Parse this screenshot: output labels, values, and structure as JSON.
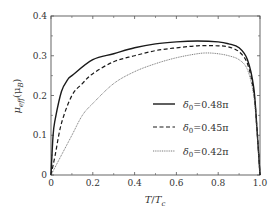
{
  "chart_data": {
    "type": "line",
    "title": "",
    "xlabel": "T/T_c",
    "ylabel": "μ_eff(μ_B)",
    "xlim": [
      0,
      1.0
    ],
    "ylim": [
      0,
      0.4
    ],
    "xticks": [
      0,
      0.2,
      0.4,
      0.6,
      0.8,
      1.0
    ],
    "xtick_labels": [
      "0",
      "0.2",
      "0.4",
      "0.6",
      "0.8",
      "1.0"
    ],
    "yticks": [
      0,
      0.1,
      0.2,
      0.3,
      0.4
    ],
    "ytick_labels": [
      "0",
      "0.1",
      "0.2",
      "0.3",
      "0.4"
    ],
    "grid": false,
    "legend_position": "lower right (inside)",
    "series": [
      {
        "name": "δ0=0.48π",
        "style": "solid",
        "x": [
          0,
          0.01,
          0.02,
          0.05,
          0.08,
          0.1,
          0.2,
          0.3,
          0.4,
          0.5,
          0.6,
          0.7,
          0.8,
          0.85,
          0.9,
          0.94,
          0.97,
          0.985,
          1.0
        ],
        "y": [
          0,
          0.1,
          0.14,
          0.21,
          0.24,
          0.25,
          0.29,
          0.305,
          0.32,
          0.33,
          0.335,
          0.337,
          0.335,
          0.33,
          0.32,
          0.29,
          0.22,
          0.12,
          0
        ]
      },
      {
        "name": "δ0=0.45π",
        "style": "dashed",
        "x": [
          0,
          0.02,
          0.05,
          0.1,
          0.15,
          0.2,
          0.3,
          0.4,
          0.5,
          0.6,
          0.7,
          0.8,
          0.85,
          0.9,
          0.94,
          0.97,
          0.985,
          1.0
        ],
        "y": [
          0,
          0.05,
          0.13,
          0.2,
          0.23,
          0.255,
          0.285,
          0.3,
          0.313,
          0.32,
          0.325,
          0.325,
          0.322,
          0.31,
          0.28,
          0.21,
          0.12,
          0
        ]
      },
      {
        "name": "δ0=0.42π",
        "style": "dotted",
        "x": [
          0,
          0.05,
          0.1,
          0.15,
          0.2,
          0.3,
          0.4,
          0.5,
          0.6,
          0.7,
          0.75,
          0.8,
          0.85,
          0.9,
          0.94,
          0.97,
          0.985,
          1.0
        ],
        "y": [
          0,
          0.05,
          0.1,
          0.15,
          0.18,
          0.23,
          0.26,
          0.28,
          0.295,
          0.305,
          0.307,
          0.305,
          0.3,
          0.29,
          0.265,
          0.2,
          0.11,
          0
        ]
      }
    ]
  },
  "legend": {
    "items": [
      {
        "label_prefix": "δ",
        "label_sub": "0",
        "label_value": "=0.48π"
      },
      {
        "label_prefix": "δ",
        "label_sub": "0",
        "label_value": "=0.45π"
      },
      {
        "label_prefix": "δ",
        "label_sub": "0",
        "label_value": "=0.42π"
      }
    ]
  },
  "axes": {
    "x_label_main": "T",
    "x_label_sep": "/",
    "x_label_T": "T",
    "x_label_sub": "c",
    "y_label_mu": "μ",
    "y_label_sub": "eff",
    "y_label_paren": "(μ",
    "y_label_sub2": "B",
    "y_label_close": ")"
  },
  "colors": {
    "line": "#1a1a1a",
    "frame": "#555555",
    "text": "#333333"
  }
}
